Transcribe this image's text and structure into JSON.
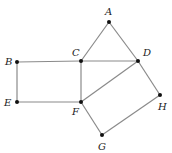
{
  "diagram": {
    "type": "geometry",
    "points": [
      {
        "id": "A",
        "label": "A",
        "x": 109,
        "y": 22,
        "lx": 105,
        "ly": 15
      },
      {
        "id": "B",
        "label": "B",
        "x": 17,
        "y": 62,
        "lx": 5,
        "ly": 65
      },
      {
        "id": "C",
        "label": "C",
        "x": 81,
        "y": 61,
        "lx": 72,
        "ly": 56
      },
      {
        "id": "D",
        "label": "D",
        "x": 138,
        "y": 61,
        "lx": 143,
        "ly": 56
      },
      {
        "id": "E",
        "label": "E",
        "x": 17,
        "y": 102,
        "lx": 4,
        "ly": 106
      },
      {
        "id": "F",
        "label": "F",
        "x": 81,
        "y": 102,
        "lx": 72,
        "ly": 115
      },
      {
        "id": "G",
        "label": "G",
        "x": 102,
        "y": 135,
        "lx": 98,
        "ly": 150
      },
      {
        "id": "H",
        "label": "H",
        "x": 160,
        "y": 95,
        "lx": 158,
        "ly": 110
      }
    ],
    "segments": [
      [
        "A",
        "C"
      ],
      [
        "A",
        "D"
      ],
      [
        "B",
        "C"
      ],
      [
        "C",
        "D"
      ],
      [
        "B",
        "E"
      ],
      [
        "E",
        "F"
      ],
      [
        "C",
        "F"
      ],
      [
        "F",
        "D"
      ],
      [
        "D",
        "H"
      ],
      [
        "H",
        "G"
      ],
      [
        "G",
        "F"
      ]
    ],
    "shapes": [
      {
        "name": "triangle ACD",
        "vertices": [
          "A",
          "C",
          "D"
        ]
      },
      {
        "name": "rectangle BCFE",
        "vertices": [
          "B",
          "C",
          "F",
          "E"
        ]
      },
      {
        "name": "rectangle DFGH",
        "vertices": [
          "D",
          "H",
          "G",
          "F"
        ]
      }
    ]
  }
}
